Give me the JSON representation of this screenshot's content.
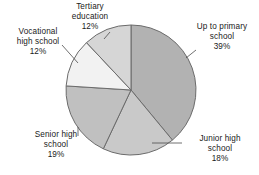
{
  "chart_data": {
    "type": "pie",
    "title": "",
    "subtitle": "",
    "xlabel": "",
    "ylabel": "",
    "grid": false,
    "legend_position": "none",
    "label_format": "name + percent",
    "start_angle_deg": 0,
    "direction": "clockwise",
    "categories": [
      "Up to primary school",
      "Junior high school",
      "Senior high school",
      "Vocational high school",
      "Tertiary education"
    ],
    "values": [
      39,
      18,
      19,
      12,
      12
    ],
    "units": "percent",
    "slices": [
      {
        "label": "Up to primary school",
        "label_line1": "Up to primary",
        "label_line2": "school",
        "percent_text": "39%",
        "value": 39,
        "color": "#b2b2b2"
      },
      {
        "label": "Junior high school",
        "label_line1": "Junior high",
        "label_line2": "school",
        "percent_text": "18%",
        "value": 18,
        "color": "#c9c9c9"
      },
      {
        "label": "Senior high school",
        "label_line1": "Senior high",
        "label_line2": "school",
        "percent_text": "19%",
        "value": 19,
        "color": "#c0c0c0"
      },
      {
        "label": "Vocational high school",
        "label_line1": "Vocational",
        "label_line2": "high school",
        "percent_text": "12%",
        "value": 12,
        "color": "#f2f2f2"
      },
      {
        "label": "Tertiary education",
        "label_line1": "Tertiary",
        "label_line2": "education",
        "percent_text": "12%",
        "value": 12,
        "color": "#d6d6d6"
      }
    ],
    "style": {
      "background": "#ffffff",
      "slice_border": "#6b6b6b",
      "text_color": "#1a1a1a",
      "leader_line_color": "#4d4d4d"
    }
  }
}
